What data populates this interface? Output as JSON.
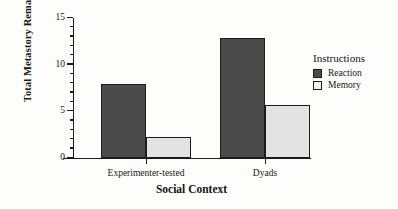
{
  "chart_data": {
    "type": "bar",
    "title": "",
    "xlabel": "Social Context",
    "ylabel": "Total Metastory Remarks",
    "categories": [
      "Experimenter-tested",
      "Dyads"
    ],
    "series": [
      {
        "name": "Reaction",
        "values": [
          7.9,
          12.9
        ],
        "color": "#4a4a4a"
      },
      {
        "name": "Memory",
        "values": [
          2.2,
          5.7
        ],
        "color": "#e3e3e3"
      }
    ],
    "ylim": [
      0,
      15
    ],
    "yticks": [
      0,
      5,
      10,
      15
    ],
    "ytick_labels": [
      "0",
      "5",
      "10",
      "15"
    ],
    "y_minor_tick_step": 1,
    "grid": false,
    "legend": {
      "title": "Instructions",
      "position": "right",
      "entries": [
        {
          "label": "Reaction",
          "color": "#4a4a4a"
        },
        {
          "label": "Memory",
          "color": "#f2f2f2"
        }
      ]
    }
  }
}
